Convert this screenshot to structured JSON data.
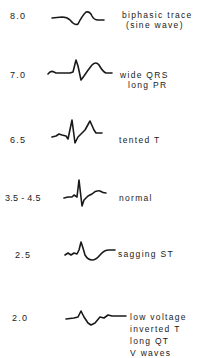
{
  "diagram": {
    "title": "",
    "rows": [
      {
        "value": "8.0",
        "trace_icon": "biphasic-sine-wave-trace",
        "lines": [
          "biphasic trace",
          "(sine wave)"
        ]
      },
      {
        "value": "7.0",
        "trace_icon": "wide-qrs-trace",
        "lines": [
          "wide QRS",
          "long PR"
        ]
      },
      {
        "value": "6.5",
        "trace_icon": "tented-t-trace",
        "lines": [
          "tented T"
        ]
      },
      {
        "value": "3.5 - 4.5",
        "trace_icon": "normal-ecg-trace",
        "lines": [
          "normal"
        ]
      },
      {
        "value": "2.5",
        "trace_icon": "sagging-st-trace",
        "lines": [
          "sagging ST"
        ]
      },
      {
        "value": "2.0",
        "trace_icon": "low-voltage-trace",
        "lines": [
          "low voltage",
          "inverted T",
          "long QT",
          "V waves"
        ]
      }
    ]
  },
  "colors": {
    "ink": "#1a1a1a",
    "background": "#ffffff"
  }
}
